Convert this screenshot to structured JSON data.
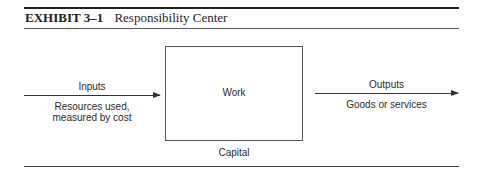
{
  "exhibit": {
    "label": "EXHIBIT 3–1",
    "title": "Responsibility Center"
  },
  "diagram": {
    "center_box": {
      "label": "Work",
      "below_label": "Capital"
    },
    "input": {
      "label": "Inputs",
      "description_line1": "Resources used,",
      "description_line2": "measured by cost"
    },
    "output": {
      "label": "Outputs",
      "description": "Goods or services"
    }
  },
  "colors": {
    "ink": "#2a2a2a",
    "rule": "#333333",
    "background": "#ffffff"
  }
}
